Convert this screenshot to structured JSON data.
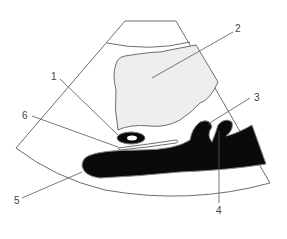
{
  "diagram": {
    "type": "ultrasound-schematic",
    "colors": {
      "outline": "#6e6e6e",
      "cystic_fill": "#eeeeee",
      "dark_fill": "#0a0a0a",
      "leader": "#555555",
      "label": "#444444"
    },
    "labels": [
      {
        "id": "1",
        "text": "1"
      },
      {
        "id": "2",
        "text": "2"
      },
      {
        "id": "3",
        "text": "3"
      },
      {
        "id": "4",
        "text": "4"
      },
      {
        "id": "5",
        "text": "5"
      },
      {
        "id": "6",
        "text": "6"
      }
    ]
  }
}
